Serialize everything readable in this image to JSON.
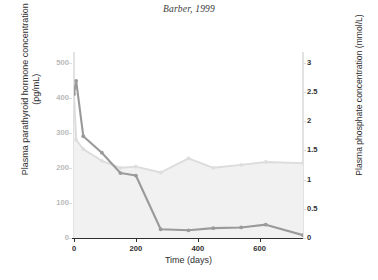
{
  "chart_data": {
    "type": "line",
    "title": "Barber, 1999",
    "xlabel": "Time (days)",
    "ylabel": "Plasma parathyroid hormone concentration (pg/mL)",
    "ylabel_right": "Plasma phosphate concentration (mmol/L)",
    "xlim": [
      0,
      740
    ],
    "ylim": [
      0,
      530
    ],
    "ylim_right": [
      0,
      3.18
    ],
    "xticks": [
      0,
      200,
      400,
      600
    ],
    "yticks": [
      0,
      100,
      200,
      300,
      400,
      500
    ],
    "yticks_right": [
      0,
      0.5,
      1,
      1.5,
      2,
      2.5,
      3
    ],
    "grid": false,
    "legend": "none",
    "series": [
      {
        "name": "Plasma parathyroid hormone concentration (pg/mL)",
        "axis": "left",
        "color": "#9a9a9a",
        "marker": "circle",
        "x": [
          0,
          7,
          30,
          90,
          150,
          200,
          280,
          370,
          450,
          540,
          620,
          740
        ],
        "y": [
          410,
          448,
          290,
          243,
          185,
          178,
          25,
          22,
          28,
          30,
          38,
          8
        ]
      },
      {
        "name": "Plasma phosphate concentration (mmol/L)",
        "axis": "right",
        "color": "#dedede",
        "fill": "#f0f0f0",
        "marker": "circle",
        "x": [
          0,
          7,
          30,
          90,
          150,
          200,
          280,
          370,
          450,
          540,
          620,
          740
        ],
        "y": [
          2.47,
          1.68,
          1.52,
          1.32,
          1.2,
          1.22,
          1.12,
          1.36,
          1.2,
          1.25,
          1.3,
          1.28
        ]
      }
    ]
  },
  "ticks": {
    "x": [
      "0",
      "200",
      "400",
      "600"
    ],
    "left": [
      "0",
      "100",
      "200",
      "300",
      "400",
      "500"
    ],
    "right": [
      "0",
      "0.5",
      "1",
      "1.5",
      "2",
      "2.5",
      "3"
    ]
  },
  "labels": {
    "title": "Barber, 1999",
    "xlabel": "Time (days)",
    "ylabel_left_line1": "Plasma parathyroid hormone concentration",
    "ylabel_left_line2": "(pg/mL)",
    "ylabel_right": "Plasma phosphate concentration (mmol/L)"
  },
  "colors": {
    "pth_line": "#9a9a9a",
    "phosphate_line": "#dcdcdc",
    "phosphate_fill": "#f1f1f1",
    "axis_dark": "#2f2f2f",
    "axis_light": "#e2e2e2",
    "tick_text_left": "#b9b9b9",
    "tick_text": "#2f2f2f"
  }
}
